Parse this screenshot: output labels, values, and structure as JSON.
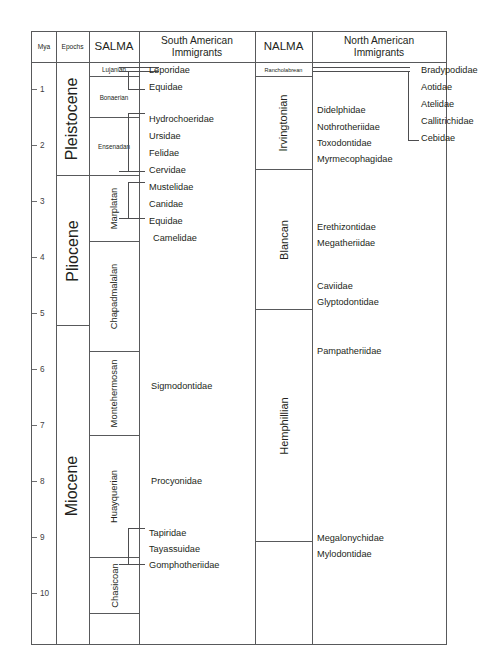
{
  "figure": {
    "type": "stratigraphic-range-chart",
    "width": 478,
    "height": 668
  },
  "columns": {
    "mya": "Mya",
    "epochs": "Epochs",
    "salma": "SALMA",
    "sa_immigrants_line1": "South American",
    "sa_immigrants_line2": "Immigrants",
    "nalma": "NALMA",
    "na_immigrants_line1": "North American",
    "na_immigrants_line2": "Immigrants"
  },
  "axis": {
    "label": "Mya",
    "ticks": [
      "1",
      "2",
      "3",
      "4",
      "5",
      "6",
      "7",
      "8",
      "9",
      "10"
    ],
    "min": 0,
    "max": 10.6,
    "direction": "increasing-downward"
  },
  "epochs": [
    {
      "name": "Pleistocene",
      "top_mya": 0,
      "base_mya": 2.58
    },
    {
      "name": "Pliocene",
      "top_mya": 2.58,
      "base_mya": 5.33
    },
    {
      "name": "Miocene",
      "top_mya": 5.33,
      "base_mya": 10.6
    }
  ],
  "salma": [
    {
      "name": "Lujanian",
      "top_mya": 0.0,
      "base_mya": 0.13,
      "size": "small"
    },
    {
      "name": "Bonaerian",
      "top_mya": 0.13,
      "base_mya": 0.78,
      "size": "small"
    },
    {
      "name": "Ensenadan",
      "top_mya": 0.78,
      "base_mya": 2.1,
      "size": "small"
    },
    {
      "name": "Marplatan",
      "top_mya": 2.1,
      "base_mya": 3.3,
      "size": "normal"
    },
    {
      "name": "Chapadmalalan",
      "top_mya": 3.3,
      "base_mya": 5.3,
      "size": "normal"
    },
    {
      "name": "Montehermosan",
      "top_mya": 5.3,
      "base_mya": 6.8,
      "size": "normal"
    },
    {
      "name": "Huayquerian",
      "top_mya": 6.8,
      "base_mya": 9.0,
      "size": "normal"
    },
    {
      "name": "Chasicoan",
      "top_mya": 9.0,
      "base_mya": 10.0,
      "size": "normal"
    }
  ],
  "nalma": [
    {
      "name": "Rancholabrean",
      "top_mya": 0.0,
      "base_mya": 0.24,
      "size": "small"
    },
    {
      "name": "Irvingtonian",
      "top_mya": 0.24,
      "base_mya": 1.9,
      "size": "normal"
    },
    {
      "name": "Blancan",
      "top_mya": 1.9,
      "base_mya": 4.9,
      "size": "normal"
    },
    {
      "name": "Hemphillian",
      "top_mya": 4.9,
      "base_mya": 9.0,
      "size": "normal"
    }
  ],
  "sa_immigrants": [
    {
      "name": "Leporidae"
    },
    {
      "name": "Equidae"
    },
    {
      "name": "Hydrochoeridae"
    },
    {
      "name": "Ursidae"
    },
    {
      "name": "Felidae"
    },
    {
      "name": "Cervidae"
    },
    {
      "name": "Mustelidae"
    },
    {
      "name": "Canidae"
    },
    {
      "name": "Equidae"
    },
    {
      "name": "Camelidae"
    },
    {
      "name": "Sigmodontidae"
    },
    {
      "name": "Procyonidae"
    },
    {
      "name": "Tapiridae"
    },
    {
      "name": "Tayassuidae"
    },
    {
      "name": "Gomphotheriidae"
    }
  ],
  "na_immigrants": [
    {
      "name": "Bradypodidae"
    },
    {
      "name": "Aotidae"
    },
    {
      "name": "Atelidae"
    },
    {
      "name": "Callitrichidae"
    },
    {
      "name": "Cebidae"
    },
    {
      "name": "Didelphidae"
    },
    {
      "name": "Nothrotheriidae"
    },
    {
      "name": "Toxodontidae"
    },
    {
      "name": "Myrmecophagidae"
    },
    {
      "name": "Erethizontidae"
    },
    {
      "name": "Megatheriidae"
    },
    {
      "name": "Caviidae"
    },
    {
      "name": "Glyptodontidae"
    },
    {
      "name": "Pampatheriidae"
    },
    {
      "name": "Megalonychidae"
    },
    {
      "name": "Mylodontidae"
    }
  ],
  "colors": {
    "frame": "#58595b",
    "text": "#231f20",
    "bracket": "#4d4d4f",
    "tick": "#6d6e71"
  }
}
